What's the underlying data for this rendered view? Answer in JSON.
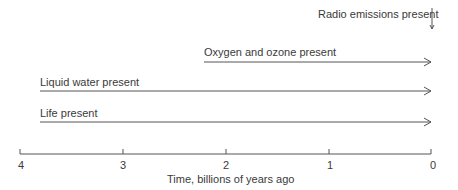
{
  "diagram": {
    "events": [
      {
        "label": "Radio emissions present",
        "start_gya": 0
      },
      {
        "label": "Oxygen and ozone present",
        "start_gya": 2.2
      },
      {
        "label": "Liquid water present",
        "start_gya": 4
      },
      {
        "label": "Life present",
        "start_gya": 4
      }
    ],
    "axis": {
      "title": "Time, billions of years ago",
      "ticks": [
        "4",
        "3",
        "2",
        "1",
        "0"
      ]
    },
    "colors": {
      "line": "#555555",
      "text": "#3a3a3a"
    }
  }
}
